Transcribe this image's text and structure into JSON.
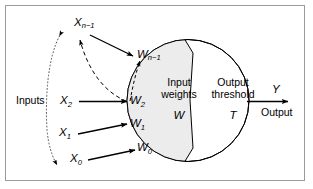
{
  "figure": {
    "type": "neuron-model-diagram",
    "border_color": "#9a9a9a",
    "background": "#ffffff",
    "node_fill_left": "#ececec",
    "node_fill_right": "#ffffff",
    "stroke_color": "#000000"
  },
  "labels": {
    "inputs_group": "Inputs",
    "output_group": "Output",
    "input_weights_line1": "Input",
    "input_weights_line2": "weights",
    "output_threshold_line1": "Output",
    "output_threshold_line2": "threshold",
    "weight_symbol": "W",
    "threshold_symbol": "T",
    "output_symbol": "Y"
  },
  "inputs": [
    {
      "name": "x-n-minus-1",
      "base": "X",
      "sub": "n−1"
    },
    {
      "name": "x-2",
      "base": "X",
      "sub": "2"
    },
    {
      "name": "x-1",
      "base": "X",
      "sub": "1"
    },
    {
      "name": "x-0",
      "base": "X",
      "sub": "0"
    }
  ],
  "weights": [
    {
      "name": "w-n-minus-1",
      "base": "W",
      "sub": "n−1"
    },
    {
      "name": "w-2",
      "base": "W",
      "sub": "2"
    },
    {
      "name": "w-1",
      "base": "W",
      "sub": "1"
    },
    {
      "name": "w-0",
      "base": "W",
      "sub": "0"
    }
  ]
}
